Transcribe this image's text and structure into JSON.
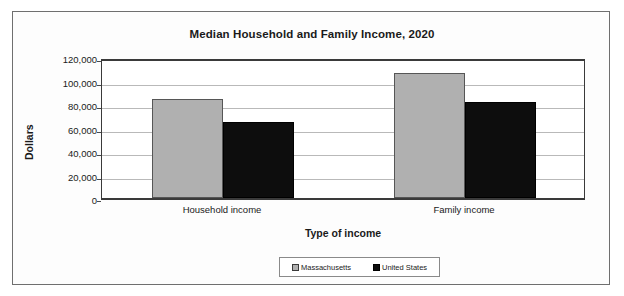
{
  "chart_data": {
    "type": "bar",
    "title": "Median Household and Family Income, 2020",
    "xlabel": "Type of income",
    "ylabel": "Dollars",
    "categories": [
      "Household income",
      "Family income"
    ],
    "series": [
      {
        "name": "Massachusetts",
        "color": "#b0b0b0",
        "values": [
          84500,
          106800
        ]
      },
      {
        "name": "United States",
        "color": "#0d0d0d",
        "values": [
          65000,
          81700
        ]
      }
    ],
    "ylim": [
      0,
      120000
    ],
    "ytick_step": 20000,
    "ytick_labels": [
      "120,000",
      "100,000",
      "80,000",
      "60,000",
      "40,000",
      "20,000",
      "0"
    ],
    "ytick_values": [
      120000,
      100000,
      80000,
      60000,
      40000,
      20000,
      0
    ],
    "grid": true,
    "legend_position": "bottom"
  },
  "frame": {
    "border_color": "#6f6f6f",
    "background": "#fdfdfd"
  }
}
